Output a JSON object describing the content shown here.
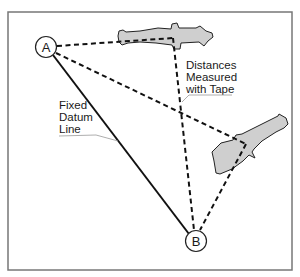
{
  "diagram": {
    "points": [
      {
        "id": "A",
        "label": "A",
        "x": 46,
        "y": 47
      },
      {
        "id": "B",
        "label": "B",
        "x": 196,
        "y": 241
      }
    ],
    "labels": {
      "datum": [
        "Fixed",
        "Datum",
        "Line"
      ],
      "distances": [
        "Distances",
        "Measured",
        "with Tape"
      ]
    },
    "colors": {
      "bone_fill": "#cfcfcf",
      "line": "#111111",
      "frame": "#777777",
      "leader": "#999999"
    },
    "connections": [
      {
        "from": "A",
        "to": "B",
        "style": "solid",
        "meaning": "Fixed Datum Line"
      },
      {
        "from": "A",
        "to": "bone-1",
        "style": "dashed"
      },
      {
        "from": "A",
        "to": "bone-2",
        "style": "dashed"
      },
      {
        "from": "B",
        "to": "bone-1",
        "style": "dashed"
      },
      {
        "from": "B",
        "to": "bone-2",
        "style": "dashed"
      }
    ]
  }
}
